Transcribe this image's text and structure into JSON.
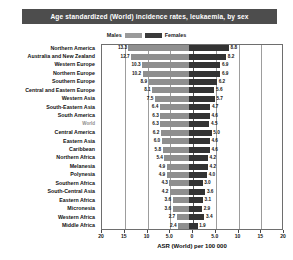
{
  "header": {
    "title": "Age standardized (World) incidence rates, leukaemia, by sex"
  },
  "legend": {
    "male_label": "Males",
    "female_label": "Females",
    "male_color": "#8f8f8f",
    "female_color": "#333333",
    "position": "top-center"
  },
  "axis": {
    "xlabel": "ASR (World) per 100 000",
    "ticks": [
      "20",
      "15",
      "10",
      "5.0",
      "0",
      "5.0",
      "10",
      "15",
      "20"
    ]
  },
  "chart_data": {
    "type": "bar",
    "orientation": "horizontal-mirrored",
    "title": "Age standardized (World) incidence rates, leukaemia, by sex",
    "subtitle": "",
    "xlabel": "ASR (World) per 100 000",
    "ylabel": "",
    "xlim": [
      -20,
      20
    ],
    "xticks": [
      -20,
      -15,
      -10,
      -5,
      0,
      5,
      10,
      15,
      20
    ],
    "xtick_labels": [
      "20",
      "15",
      "10",
      "5.0",
      "0",
      "5.0",
      "10",
      "15",
      "20"
    ],
    "grid": true,
    "legend": [
      "Males",
      "Females"
    ],
    "categories": [
      "Northern America",
      "Australia and New Zealand",
      "Western Europe",
      "Northern Europe",
      "Southern Europe",
      "Central and Eastern Europe",
      "Western Asia",
      "South-Eastern Asia",
      "South America",
      "World",
      "Central America",
      "Eastern Asia",
      "Caribbean",
      "Northern Africa",
      "Melanesia",
      "Polynesia",
      "Southern Africa",
      "South-Central Asia",
      "Eastern Africa",
      "Micronesia",
      "Western Africa",
      "Middle Africa"
    ],
    "series": [
      {
        "name": "Males",
        "side": "left",
        "color": "#8f8f8f",
        "values": [
          13.3,
          12.7,
          10.3,
          10.2,
          8.9,
          8.1,
          7.5,
          6.4,
          6.3,
          6.3,
          6.2,
          6.0,
          5.8,
          5.4,
          4.9,
          4.9,
          4.3,
          4.2,
          3.6,
          3.6,
          2.7,
          2.4
        ]
      },
      {
        "name": "Females",
        "side": "right",
        "color": "#333333",
        "values": [
          8.8,
          8.2,
          6.9,
          6.9,
          6.2,
          5.6,
          5.7,
          4.7,
          4.6,
          4.5,
          5.0,
          4.6,
          4.6,
          4.2,
          4.2,
          4.0,
          3.0,
          3.6,
          3.1,
          2.9,
          3.4,
          1.9
        ]
      }
    ]
  }
}
